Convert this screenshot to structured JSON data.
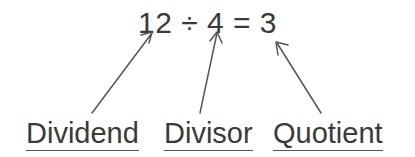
{
  "diagram": {
    "equation": {
      "text": "12 ÷ 4 = 3",
      "dividend": "12",
      "operator": "÷",
      "divisor": "4",
      "equals": "=",
      "quotient": "3"
    },
    "labels": [
      {
        "id": "dividend",
        "text": "Dividend"
      },
      {
        "id": "divisor",
        "text": "Divisor"
      },
      {
        "id": "quotient",
        "text": "Quotient"
      }
    ],
    "arrows": [
      {
        "id": "arrow-dividend",
        "from": [
          92,
          113
        ],
        "to": [
          152,
          33
        ],
        "points_to": "12"
      },
      {
        "id": "arrow-divisor",
        "from": [
          200,
          113
        ],
        "to": [
          217,
          33
        ],
        "points_to": "4"
      },
      {
        "id": "arrow-quotient",
        "from": [
          321,
          113
        ],
        "to": [
          277,
          43
        ],
        "points_to": "3"
      }
    ],
    "colors": {
      "background": "#ffffff",
      "text": "#3a3a3a",
      "stroke": "#555555"
    }
  }
}
